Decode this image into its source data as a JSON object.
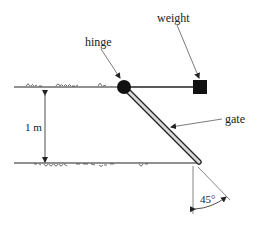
{
  "diagram": {
    "labels": {
      "hinge": "hinge",
      "weight": "weight",
      "gate": "gate",
      "height": "1 m",
      "angle": "45°"
    },
    "colors": {
      "line": "#222222",
      "fill": "#111111",
      "gate_fill": "#d9d9d9",
      "background": "#ffffff"
    },
    "dimensions": {
      "vertical_distance": "1 m",
      "gate_angle_from_vertical": "45°"
    }
  }
}
